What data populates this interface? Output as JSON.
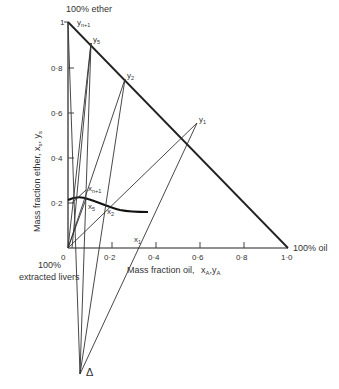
{
  "title_top": "100% ether",
  "corner_right": "100% oil",
  "corner_bottom_line1": "100%",
  "corner_bottom_line2": "extracted livers",
  "x_axis": {
    "label": "Mass fraction oil,",
    "label_vars": "x",
    "label_vars_sub": "A",
    "label_vars2": "y",
    "label_vars2_sub": "A",
    "ticks": [
      "0",
      "0·2",
      "0·4",
      "0·6",
      "0·8",
      "1·0"
    ]
  },
  "y_axis": {
    "label": "Mass fraction ether, x",
    "label_sub1": "s",
    "label_mid": ", y",
    "label_sub2": "s",
    "ticks": [
      "0·2",
      "0·4",
      "0·6",
      "0·8",
      "1"
    ]
  },
  "points": {
    "y_n1": "y",
    "y_n1_sub": "n+1",
    "y5": "y",
    "y5_sub": "5",
    "y2": "y",
    "y2_sub": "2",
    "y1": "y",
    "y1_sub": "1",
    "x_n1": "x",
    "x_n1_sub": "n+1",
    "x5": "x",
    "x5_sub": "5",
    "x2": "x",
    "x2_sub": "2",
    "x1": "x",
    "x1_sub": "1",
    "delta": "Δ"
  },
  "colors": {
    "line": "#222222",
    "text": "#333333"
  }
}
